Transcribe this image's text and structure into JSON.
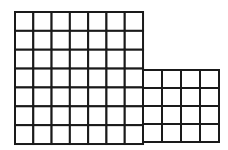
{
  "diagram": {
    "line_color": "#1a1a1a",
    "background": "#ffffff",
    "grids": [
      {
        "name": "large-grid",
        "x": 15,
        "y": 12,
        "cols": 7,
        "rows": 7,
        "cell_w": 18.29,
        "cell_h": 18.86
      },
      {
        "name": "small-grid",
        "x": 143,
        "y": 70,
        "cols": 4,
        "rows": 4,
        "cell_w": 19,
        "cell_h": 18
      }
    ]
  }
}
